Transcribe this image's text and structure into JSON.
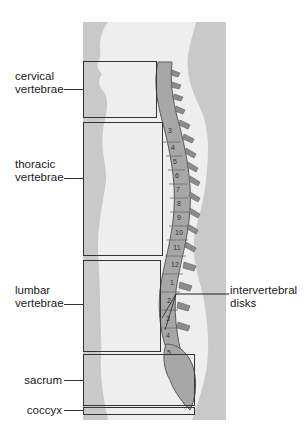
{
  "figure": {
    "labels": {
      "cervical": [
        "cervical",
        "vertebrae"
      ],
      "thoracic": [
        "thoracic",
        "vertebrae"
      ],
      "lumbar": [
        "lumbar",
        "vertebrae"
      ],
      "sacrum": "sacrum",
      "coccyx": "coccyx",
      "disks": [
        "intervertebral",
        "disks"
      ]
    },
    "thoracic_numbers": [
      "3",
      "4",
      "5",
      "6",
      "7",
      "8",
      "9",
      "10",
      "11",
      "12"
    ],
    "lumbar_numbers": [
      "1",
      "2",
      "3",
      "4",
      "5"
    ],
    "colors": {
      "background_panel": "#c9c9c9",
      "body_silhouette": "#eeeeee",
      "bone": "#a7a7a7",
      "bone_dark": "#5a5a5a",
      "line": "#333333"
    }
  }
}
